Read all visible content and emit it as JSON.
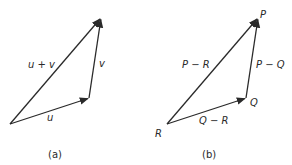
{
  "panels": [
    {
      "caption": "(a)",
      "vectors": [
        {
          "label": "u",
          "from": [
            10,
            124
          ],
          "to": [
            89,
            98
          ]
        },
        {
          "label": "v",
          "from": [
            89,
            98
          ],
          "to": [
            101,
            18
          ]
        },
        {
          "label": "u + v",
          "from": [
            10,
            124
          ],
          "to": [
            101,
            18
          ]
        }
      ]
    },
    {
      "caption": "(b)",
      "points": [
        {
          "label": "R",
          "pos": [
            167,
            124
          ]
        },
        {
          "label": "Q",
          "pos": [
            246,
            98
          ]
        },
        {
          "label": "P",
          "pos": [
            258,
            18
          ]
        }
      ],
      "vectors": [
        {
          "label": "Q − R",
          "from": [
            167,
            124
          ],
          "to": [
            246,
            98
          ]
        },
        {
          "label": "P − Q",
          "from": [
            246,
            98
          ],
          "to": [
            258,
            18
          ]
        },
        {
          "label": "P − R",
          "from": [
            167,
            124
          ],
          "to": [
            258,
            18
          ]
        }
      ]
    }
  ],
  "colors": {
    "ink": "#2a2a2a",
    "background": "#ffffff"
  }
}
